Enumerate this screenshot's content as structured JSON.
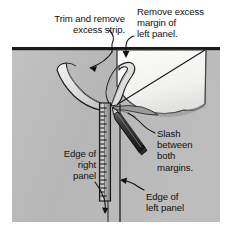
{
  "figure": {
    "background_color": "#ffffff",
    "panel_color": "#b9b9b9",
    "panel_edge_color": "#1a1a1a",
    "white_panel_color": "#f4f4f2",
    "ink_color": "#111111"
  },
  "callouts": {
    "trim_strip": "Trim and remove\nexcess strip.",
    "remove_margin": "Remove excess\nmargin of\nleft panel.",
    "slash": "Slash\nbetween\nboth\nmargins.",
    "right_panel": "Edge of\nright\npanel",
    "left_panel": "Edge of\nleft panel"
  },
  "elements": {
    "straightedge": "metal-ruler",
    "knife": "utility-knife",
    "left_strip": "trimmed-excess-strip",
    "center_curl": "curled-margin",
    "white_flap": "peeled-left-panel"
  }
}
